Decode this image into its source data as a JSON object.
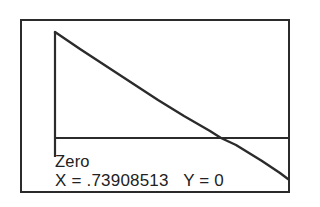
{
  "screen": {
    "title": "graphing-calculator-zero-result",
    "border_color": "#2b2b2b",
    "background_color": "#ffffff",
    "ink_color": "#2b2b2b"
  },
  "readout": {
    "status_label": "Zero",
    "coordinates": "X = .73908513   Y = 0",
    "x_label": "X =",
    "x_value": ".73908513",
    "y_label": "Y =",
    "y_value": "0"
  },
  "chart_data": {
    "type": "line",
    "title": "",
    "xlabel": "",
    "ylabel": "",
    "grid": false,
    "legend": null,
    "axes": {
      "x_axis_drawn": true,
      "y_axis_drawn": true,
      "x_axis_pixel_y": 117,
      "y_axis_pixel_x": 33
    },
    "annotations": [
      {
        "text": "Zero",
        "kind": "root-marker-label"
      },
      {
        "text": "X = .73908513   Y = 0",
        "kind": "root-coordinates"
      }
    ],
    "root": {
      "x": 0.73908513,
      "y": 0
    },
    "series": [
      {
        "name": "y = cos(x) - x",
        "points_pixel": [
          [
            33,
            11
          ],
          [
            58,
            28
          ],
          [
            84,
            45
          ],
          [
            110,
            62
          ],
          [
            136,
            79
          ],
          [
            162,
            95
          ],
          [
            188,
            110
          ],
          [
            199,
            117
          ],
          [
            214,
            124
          ],
          [
            240,
            140
          ],
          [
            258,
            152
          ],
          [
            266,
            158
          ]
        ]
      }
    ]
  }
}
